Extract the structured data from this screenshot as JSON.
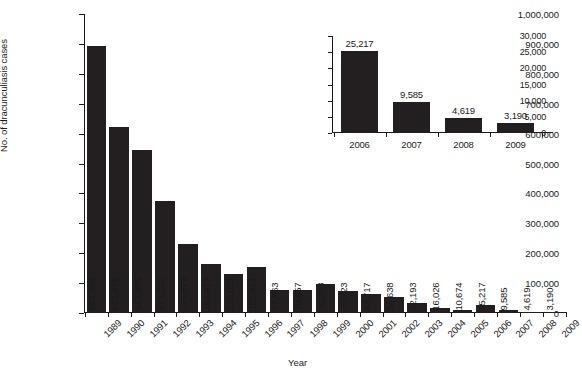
{
  "chart_data": [
    {
      "id": "main",
      "type": "bar",
      "title": "",
      "xlabel": "Year",
      "ylabel": "No. of dracunculiasis cases",
      "ylim": [
        0,
        1000000
      ],
      "grid": false,
      "legend": "none",
      "ytick_labels": [
        "1,000,000",
        "900,000",
        "800,000",
        "700,000",
        "600,000",
        "500,000",
        "400,000",
        "300,000",
        "200,000",
        "100,000",
        "0"
      ],
      "ytick_values": [
        1000000,
        900000,
        800000,
        700000,
        600000,
        500000,
        400000,
        300000,
        200000,
        100000,
        0
      ],
      "categories": [
        "1989",
        "1990",
        "1991",
        "1992",
        "1993",
        "1994",
        "1995",
        "1996",
        "1997",
        "1998",
        "1999",
        "2000",
        "2001",
        "2002",
        "2003",
        "2004",
        "2005",
        "2006",
        "2007",
        "2008",
        "2009"
      ],
      "values": [
        892055,
        623579,
        543585,
        374202,
        229773,
        164977,
        129852,
        152814,
        77863,
        78557,
        96293,
        75223,
        63717,
        54638,
        32193,
        16026,
        10674,
        25217,
        9585,
        4619,
        3190
      ],
      "value_labels": [
        "892,055",
        "623,579",
        "543,585",
        "374,202",
        "229,773",
        "164,977",
        "129,852",
        "152,814",
        "77,863",
        "78,557",
        "96,293",
        "75,223",
        "63,717",
        "54,638",
        "32,193",
        "16,026",
        "10,674",
        "25,217",
        "9,585",
        "4,619",
        "3,190"
      ],
      "bar_color": "#231f20"
    },
    {
      "id": "inset",
      "type": "bar",
      "title": "",
      "xlabel": "",
      "ylabel": "",
      "ylim": [
        0,
        30000
      ],
      "grid": false,
      "legend": "none",
      "ytick_labels": [
        "30,000",
        "25,000",
        "20,000",
        "15,000",
        "10,000",
        "5,000",
        "0"
      ],
      "ytick_values": [
        30000,
        25000,
        20000,
        15000,
        10000,
        5000,
        0
      ],
      "categories": [
        "2006",
        "2007",
        "2008",
        "2009"
      ],
      "values": [
        25217,
        9585,
        4619,
        3190
      ],
      "value_labels": [
        "25,217",
        "9,585",
        "4,619",
        "3,190"
      ],
      "bar_color": "#231f20"
    }
  ]
}
